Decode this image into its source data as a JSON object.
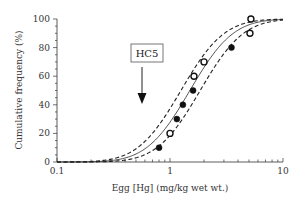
{
  "chart_data": {
    "type": "scatter",
    "title": "",
    "xlabel": "Egg [Hg] (mg/kg wet wt.)",
    "ylabel": "Cumulative frequency (%)",
    "xscale": "log",
    "xlim": [
      0.1,
      10
    ],
    "ylim": [
      0,
      100
    ],
    "x_ticks": [
      "0.1",
      "1",
      "10"
    ],
    "y_ticks": [
      "0",
      "20",
      "40",
      "60",
      "80",
      "100"
    ],
    "grid": false,
    "legend": null,
    "series": [
      {
        "name": "filled points",
        "marker": "filled-circle",
        "points": [
          {
            "x": 0.8,
            "y": 10
          },
          {
            "x": 1.15,
            "y": 30
          },
          {
            "x": 1.3,
            "y": 40
          },
          {
            "x": 1.6,
            "y": 50
          },
          {
            "x": 3.5,
            "y": 80
          }
        ]
      },
      {
        "name": "open points",
        "marker": "open-circle",
        "points": [
          {
            "x": 1.0,
            "y": 20
          },
          {
            "x": 1.63,
            "y": 60
          },
          {
            "x": 2.0,
            "y": 70
          },
          {
            "x": 5.1,
            "y": 90
          },
          {
            "x": 5.2,
            "y": 100
          }
        ]
      },
      {
        "name": "fitted curve",
        "style": "solid",
        "model": "log-normal CDF",
        "median": 1.5,
        "log10_sigma": 0.3
      },
      {
        "name": "upper confidence bound",
        "style": "dashed",
        "model": "log-normal CDF",
        "median": 1.25,
        "log10_sigma": 0.3
      },
      {
        "name": "lower confidence bound",
        "style": "dashed",
        "model": "log-normal CDF",
        "median": 1.85,
        "log10_sigma": 0.3
      }
    ],
    "annotations": [
      {
        "text": "HC5",
        "type": "boxed-label-with-down-arrow",
        "x": 0.565
      }
    ]
  },
  "labels": {
    "xlabel": "Egg [Hg] (mg/kg wet wt.)",
    "ylabel": "Cumulative frequency (%)",
    "hc5": "HC5"
  }
}
